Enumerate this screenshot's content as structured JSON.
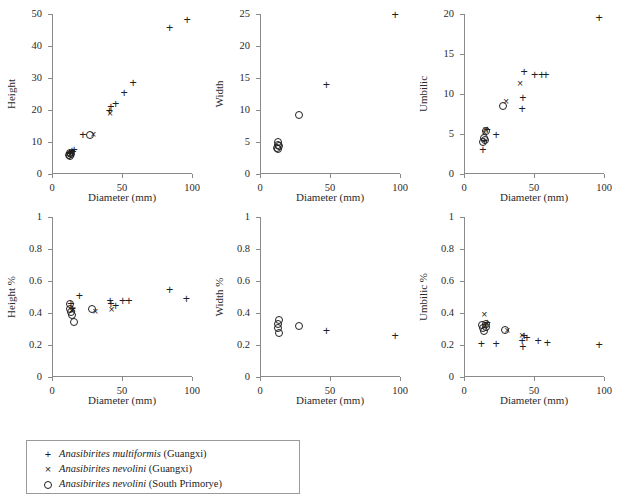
{
  "figure": {
    "title": "",
    "xlabel": "Diameter (mm)"
  },
  "legend": {
    "items": [
      {
        "symbol": "+",
        "symbol_name": "plus-marker",
        "species": "Anasibirites multiformis",
        "locality": "(Guangxi)"
      },
      {
        "symbol": "×",
        "symbol_name": "cross-marker",
        "species": "Anasibirites nevolini",
        "locality": "(Guangxi)"
      },
      {
        "symbol": "○",
        "symbol_name": "circle-marker",
        "species": "Anasibirites nevolini",
        "locality": "(South Primorye)"
      }
    ]
  },
  "chart_data": [
    {
      "id": "height-vs-diameter",
      "type": "scatter",
      "title": "",
      "xlabel": "Diameter (mm)",
      "ylabel": "Height",
      "xlim": [
        0,
        100
      ],
      "ylim": [
        0,
        50
      ],
      "xticks": [
        0,
        50,
        100
      ],
      "yticks": [
        0,
        10,
        20,
        30,
        40,
        50
      ],
      "xticklabels": [
        "0",
        "50",
        "100"
      ],
      "yticklabels": [
        "0",
        "10",
        "20",
        "30",
        "40",
        "50"
      ],
      "grid": false,
      "legend_position": "below-figure",
      "series": [
        {
          "name": "Anasibirites multiformis (Guangxi)",
          "marker": "plus",
          "points": [
            [
              12.5,
              6.6
            ],
            [
              13.2,
              6.2
            ],
            [
              14.3,
              7.2
            ],
            [
              15.0,
              6.8
            ],
            [
              15.8,
              7.4
            ],
            [
              22.0,
              12.2
            ],
            [
              41.0,
              19.8
            ],
            [
              42.0,
              21.0
            ],
            [
              45.5,
              21.8
            ],
            [
              51.5,
              25.2
            ],
            [
              58.0,
              28.3
            ],
            [
              84.0,
              45.6
            ],
            [
              96.5,
              48.2
            ]
          ]
        },
        {
          "name": "Anasibirites nevolini (Guangxi)",
          "marker": "cross",
          "points": [
            [
              13.0,
              6.3
            ],
            [
              14.0,
              6.5
            ],
            [
              29.5,
              12.6
            ],
            [
              41.5,
              19.2
            ]
          ]
        },
        {
          "name": "Anasibirites nevolini (South Primorye)",
          "marker": "circle",
          "points": [
            [
              12.0,
              6.0
            ],
            [
              12.6,
              6.5
            ],
            [
              13.0,
              5.6
            ],
            [
              13.6,
              6.3
            ],
            [
              27.0,
              12.3
            ]
          ]
        }
      ]
    },
    {
      "id": "width-vs-diameter",
      "type": "scatter",
      "title": "",
      "xlabel": "Diameter (mm)",
      "ylabel": "Width",
      "xlim": [
        0,
        100
      ],
      "ylim": [
        0,
        25
      ],
      "xticks": [
        0,
        50,
        100
      ],
      "yticks": [
        0,
        5,
        10,
        15,
        20,
        25
      ],
      "xticklabels": [
        "0",
        "50",
        "100"
      ],
      "yticklabels": [
        "0",
        "5",
        "10",
        "15",
        "20",
        "25"
      ],
      "grid": false,
      "legend_position": "below-figure",
      "series": [
        {
          "name": "Anasibirites multiformis (Guangxi)",
          "marker": "plus",
          "points": [
            [
              47.5,
              13.9
            ],
            [
              96.5,
              24.8
            ]
          ]
        },
        {
          "name": "Anasibirites nevolini (Guangxi)",
          "marker": "cross",
          "points": []
        },
        {
          "name": "Anasibirites nevolini (South Primorye)",
          "marker": "circle",
          "points": [
            [
              12.2,
              4.1
            ],
            [
              12.6,
              4.6
            ],
            [
              13.0,
              5.0
            ],
            [
              13.2,
              3.9
            ],
            [
              13.6,
              4.4
            ],
            [
              27.5,
              9.2
            ]
          ]
        }
      ]
    },
    {
      "id": "umbilic-vs-diameter",
      "type": "scatter",
      "title": "",
      "xlabel": "Diameter (mm)",
      "ylabel": "Umbilic",
      "xlim": [
        0,
        100
      ],
      "ylim": [
        0,
        20
      ],
      "xticks": [
        0,
        50,
        100
      ],
      "yticks": [
        0,
        5,
        10,
        15,
        20
      ],
      "xticklabels": [
        "0",
        "50",
        "100"
      ],
      "yticklabels": [
        "0",
        "5",
        "10",
        "15",
        "20"
      ],
      "grid": false,
      "legend_position": "below-figure",
      "series": [
        {
          "name": "Anasibirites multiformis (Guangxi)",
          "marker": "plus",
          "points": [
            [
              13.5,
              3.0
            ],
            [
              14.5,
              4.1
            ],
            [
              16.5,
              5.5
            ],
            [
              23.0,
              4.9
            ],
            [
              41.5,
              8.1
            ],
            [
              42.0,
              9.5
            ],
            [
              43.0,
              12.7
            ],
            [
              50.5,
              12.4
            ],
            [
              55.5,
              12.4
            ],
            [
              58.5,
              12.4
            ],
            [
              96.5,
              19.5
            ]
          ]
        },
        {
          "name": "Anasibirites nevolini (Guangxi)",
          "marker": "cross",
          "points": [
            [
              14.5,
              5.3
            ],
            [
              15.5,
              5.6
            ],
            [
              30.0,
              9.1
            ],
            [
              40.0,
              11.4
            ]
          ]
        },
        {
          "name": "Anasibirites nevolini (South Primorye)",
          "marker": "circle",
          "points": [
            [
              13.5,
              4.0
            ],
            [
              14.0,
              4.5
            ],
            [
              15.0,
              4.2
            ],
            [
              16.0,
              5.4
            ],
            [
              27.5,
              8.5
            ]
          ]
        }
      ]
    },
    {
      "id": "height-pct-vs-diameter",
      "type": "scatter",
      "title": "",
      "xlabel": "Diameter (mm)",
      "ylabel": "Height %",
      "xlim": [
        0,
        100
      ],
      "ylim": [
        0,
        1
      ],
      "xticks": [
        0,
        50,
        100
      ],
      "yticks": [
        0,
        0.2,
        0.4,
        0.6,
        0.8,
        1
      ],
      "xticklabels": [
        "0",
        "50",
        "100"
      ],
      "yticklabels": [
        "0",
        "0.2",
        "0.4",
        "0.6",
        "0.8",
        "1"
      ],
      "grid": false,
      "legend_position": "below-figure",
      "series": [
        {
          "name": "Anasibirites multiformis (Guangxi)",
          "marker": "plus",
          "points": [
            [
              13.5,
              0.455
            ],
            [
              14.5,
              0.425
            ],
            [
              19.5,
              0.505
            ],
            [
              41.5,
              0.475
            ],
            [
              42.0,
              0.455
            ],
            [
              45.5,
              0.445
            ],
            [
              50.5,
              0.475
            ],
            [
              55.0,
              0.475
            ],
            [
              84.0,
              0.545
            ],
            [
              96.0,
              0.49
            ]
          ]
        },
        {
          "name": "Anasibirites nevolini (Guangxi)",
          "marker": "cross",
          "points": [
            [
              14.0,
              0.42
            ],
            [
              15.0,
              0.425
            ],
            [
              31.0,
              0.415
            ],
            [
              42.5,
              0.425
            ]
          ]
        },
        {
          "name": "Anasibirites nevolini (South Primorye)",
          "marker": "circle",
          "points": [
            [
              12.5,
              0.455
            ],
            [
              13.0,
              0.425
            ],
            [
              13.5,
              0.405
            ],
            [
              14.0,
              0.385
            ],
            [
              16.0,
              0.345
            ],
            [
              28.5,
              0.425
            ]
          ]
        }
      ]
    },
    {
      "id": "width-pct-vs-diameter",
      "type": "scatter",
      "title": "",
      "xlabel": "Diameter (mm)",
      "ylabel": "Width %",
      "xlim": [
        0,
        100
      ],
      "ylim": [
        0,
        1
      ],
      "xticks": [
        0,
        50,
        100
      ],
      "yticks": [
        0,
        0.2,
        0.4,
        0.6,
        0.8,
        1
      ],
      "xticklabels": [
        "0",
        "50",
        "100"
      ],
      "yticklabels": [
        "0",
        "0.2",
        "0.4",
        "0.6",
        "0.8",
        "1"
      ],
      "grid": false,
      "legend_position": "below-figure",
      "series": [
        {
          "name": "Anasibirites multiformis (Guangxi)",
          "marker": "plus",
          "points": [
            [
              47.5,
              0.29
            ],
            [
              96.5,
              0.255
            ]
          ]
        },
        {
          "name": "Anasibirites nevolini (Guangxi)",
          "marker": "cross",
          "points": []
        },
        {
          "name": "Anasibirites nevolini (South Primorye)",
          "marker": "circle",
          "points": [
            [
              12.5,
              0.305
            ],
            [
              13.0,
              0.33
            ],
            [
              13.5,
              0.355
            ],
            [
              13.8,
              0.275
            ],
            [
              27.5,
              0.32
            ]
          ]
        }
      ]
    },
    {
      "id": "umbilic-pct-vs-diameter",
      "type": "scatter",
      "title": "",
      "xlabel": "Diameter (mm)",
      "ylabel": "Umbilic %",
      "xlim": [
        0,
        100
      ],
      "ylim": [
        0,
        1
      ],
      "xticks": [
        0,
        50,
        100
      ],
      "yticks": [
        0,
        0.2,
        0.4,
        0.6,
        0.8,
        1
      ],
      "xticklabels": [
        "0",
        "50",
        "100"
      ],
      "yticklabels": [
        "0",
        "0.2",
        "0.4",
        "0.6",
        "0.8",
        "1"
      ],
      "grid": false,
      "legend_position": "below-figure",
      "series": [
        {
          "name": "Anasibirites multiformis (Guangxi)",
          "marker": "plus",
          "points": [
            [
              12.5,
              0.205
            ],
            [
              16.5,
              0.335
            ],
            [
              23.0,
              0.205
            ],
            [
              41.5,
              0.225
            ],
            [
              42.0,
              0.19
            ],
            [
              43.0,
              0.255
            ],
            [
              45.0,
              0.245
            ],
            [
              53.0,
              0.225
            ],
            [
              59.5,
              0.21
            ],
            [
              96.5,
              0.2
            ]
          ]
        },
        {
          "name": "Anasibirites nevolini (Guangxi)",
          "marker": "cross",
          "points": [
            [
              14.5,
              0.395
            ],
            [
              15.5,
              0.325
            ],
            [
              31.0,
              0.295
            ],
            [
              41.5,
              0.26
            ]
          ]
        },
        {
          "name": "Anasibirites nevolini (South Primorye)",
          "marker": "circle",
          "points": [
            [
              13.0,
              0.325
            ],
            [
              13.5,
              0.305
            ],
            [
              14.0,
              0.285
            ],
            [
              15.5,
              0.33
            ],
            [
              16.0,
              0.31
            ],
            [
              29.0,
              0.295
            ]
          ]
        }
      ]
    }
  ]
}
